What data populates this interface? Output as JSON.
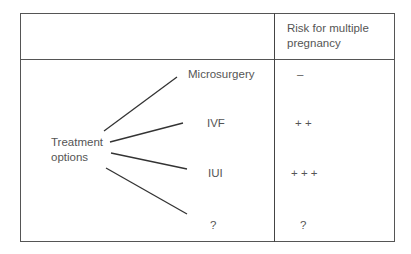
{
  "table": {
    "header": {
      "left": "",
      "right": "Risk for multiple pregnancy"
    },
    "root_label": "Treatment options",
    "rows": [
      {
        "option": "Microsurgery",
        "risk": "–"
      },
      {
        "option": "IVF",
        "risk": "+ +"
      },
      {
        "option": "IUI",
        "risk": "+ + +"
      },
      {
        "option": "?",
        "risk": "?"
      }
    ]
  },
  "colors": {
    "border": "#555555",
    "text": "#555555",
    "lines": "#333333"
  }
}
